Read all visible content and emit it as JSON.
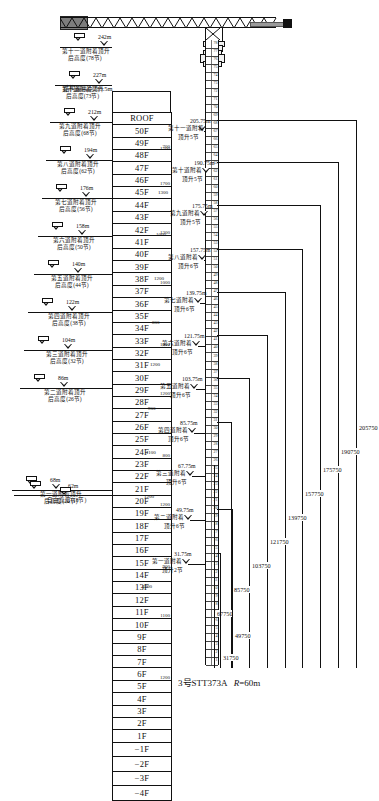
{
  "caption": {
    "model": "3号STT373A",
    "radius_prefix": "R",
    "radius_value": "=60m"
  },
  "structure": {
    "top_label": "结构最高点235.5m"
  },
  "floors": [
    {
      "label": "ROOF",
      "sub": ""
    },
    {
      "label": "50F",
      "sub": ""
    },
    {
      "label": "49F",
      "sub": "700"
    },
    {
      "label": "48F",
      "sub": ""
    },
    {
      "label": "47F",
      "sub": ""
    },
    {
      "label": "46F",
      "sub": "1700"
    },
    {
      "label": "45F",
      "sub": ""
    },
    {
      "label": "44F",
      "sub": ""
    },
    {
      "label": "43F",
      "sub": ""
    },
    {
      "label": "42F",
      "sub": "1300"
    },
    {
      "label": "41F",
      "sub": ""
    },
    {
      "label": "40F",
      "sub": ""
    },
    {
      "label": "39F",
      "sub": ""
    },
    {
      "label": "38F",
      "sub": "1000"
    },
    {
      "label": "37F",
      "sub": ""
    },
    {
      "label": "36F",
      "sub": ""
    },
    {
      "label": "35F",
      "sub": ""
    },
    {
      "label": "34F",
      "sub": ""
    },
    {
      "label": "33F",
      "sub": "1000"
    },
    {
      "label": "32F",
      "sub": ""
    },
    {
      "label": "31F",
      "sub": ""
    },
    {
      "label": "30F",
      "sub": ""
    },
    {
      "label": "29F",
      "sub": "1200"
    },
    {
      "label": "28F",
      "sub": ""
    },
    {
      "label": "27F",
      "sub": ""
    },
    {
      "label": "26F",
      "sub": ""
    },
    {
      "label": "25F",
      "sub": ""
    },
    {
      "label": "24F",
      "sub": "800"
    },
    {
      "label": "23F",
      "sub": ""
    },
    {
      "label": "22F",
      "sub": ""
    },
    {
      "label": "21F",
      "sub": ""
    },
    {
      "label": "20F",
      "sub": "1200"
    },
    {
      "label": "19F",
      "sub": ""
    },
    {
      "label": "18F",
      "sub": ""
    },
    {
      "label": "17F",
      "sub": ""
    },
    {
      "label": "16F",
      "sub": ""
    },
    {
      "label": "15F",
      "sub": "900"
    },
    {
      "label": "14F",
      "sub": ""
    },
    {
      "label": "13F",
      "sub": ""
    },
    {
      "label": "12F",
      "sub": ""
    },
    {
      "label": "11F",
      "sub": "1100"
    },
    {
      "label": "10F",
      "sub": ""
    },
    {
      "label": "9F",
      "sub": ""
    },
    {
      "label": "8F",
      "sub": ""
    },
    {
      "label": "7F",
      "sub": ""
    },
    {
      "label": "6F",
      "sub": "1200"
    },
    {
      "label": "5F",
      "sub": ""
    },
    {
      "label": "4F",
      "sub": ""
    },
    {
      "label": "3F",
      "sub": ""
    },
    {
      "label": "2F",
      "sub": ""
    },
    {
      "label": "1F",
      "sub": ""
    },
    {
      "label": "−1F",
      "sub": ""
    },
    {
      "label": "−2F",
      "sub": ""
    },
    {
      "label": "−3F",
      "sub": ""
    },
    {
      "label": "−4F",
      "sub": ""
    }
  ],
  "left_marks": [
    {
      "height": "242m",
      "note_line1": "第十一道附着顶升",
      "note_line2": "后高度(78节)"
    },
    {
      "height": "227m",
      "note_line1": "第十道附着顶升",
      "note_line2": "后高度(73节)"
    },
    {
      "height": "212m",
      "note_line1": "第九道附着顶升",
      "note_line2": "后高度(68节)"
    },
    {
      "height": "194m",
      "note_line1": "第八道附着顶升",
      "note_line2": "后高度(62节)"
    },
    {
      "height": "176m",
      "note_line1": "第七道附着顶升",
      "note_line2": "后高度(56节)"
    },
    {
      "height": "158m",
      "note_line1": "第六道附着顶升",
      "note_line2": "后高度(50节)"
    },
    {
      "height": "140m",
      "note_line1": "第五道附着顶升",
      "note_line2": "后高度(44节)"
    },
    {
      "height": "122m",
      "note_line1": "第四道附着顶升",
      "note_line2": "后高度(38节)"
    },
    {
      "height": "104m",
      "note_line1": "第三道附着顶升",
      "note_line2": "后高度(32节)"
    },
    {
      "height": "86m",
      "note_line1": "第二道附着顶升",
      "note_line2": "后高度(26节)"
    },
    {
      "height": "68m",
      "note_line1": "第一道附着顶升",
      "note_line2": "后高度(20节)"
    }
  ],
  "free_height": {
    "height": "62m",
    "label": "自由高度(18节)"
  },
  "attachments": [
    {
      "elev": "205.75m",
      "name": "第十一道附着",
      "jack": "顶升5节"
    },
    {
      "elev": "190.75m",
      "name": "第十道附着",
      "jack": "顶升5节"
    },
    {
      "elev": "175.75m",
      "name": "第九道附着",
      "jack": "顶升5节"
    },
    {
      "elev": "157.75m",
      "name": "第八道附着",
      "jack": "顶升6节"
    },
    {
      "elev": "139.75m",
      "name": "第七道附着",
      "jack": "顶升6节"
    },
    {
      "elev": "121.75m",
      "name": "第六道附着",
      "jack": "顶升6节"
    },
    {
      "elev": "103.75m",
      "name": "第五道附着",
      "jack": "顶升6节"
    },
    {
      "elev": "85.75m",
      "name": "第四道附着",
      "jack": "顶升6节"
    },
    {
      "elev": "67.75m",
      "name": "第三道附着",
      "jack": "顶升6节"
    },
    {
      "elev": "49.75m",
      "name": "第二道附着",
      "jack": "顶升6节"
    },
    {
      "elev": "31.75m",
      "name": "第一道附着",
      "jack": "顶升2节"
    }
  ],
  "attachment_offsets": [
    "1700",
    "1300",
    "1000",
    "1200",
    "800",
    "1200",
    "900",
    "1100",
    "1200",
    "4200"
  ],
  "right_dims": [
    "205750",
    "190750",
    "175750",
    "157750",
    "139750",
    "121750",
    "103750",
    "85750",
    "67750",
    "49750",
    "31750"
  ],
  "chart_data": {
    "type": "table",
    "categories": [
      "第一道",
      "第二道",
      "第三道",
      "第四道",
      "第五道",
      "第六道",
      "第七道",
      "第八道",
      "第九道",
      "第十道",
      "第十一道"
    ],
    "series": [
      {
        "name": "附着标高(m)",
        "values": [
          31.75,
          49.75,
          67.75,
          85.75,
          103.75,
          121.75,
          139.75,
          157.75,
          175.75,
          190.75,
          205.75
        ]
      },
      {
        "name": "顶升后高度(m)",
        "values": [
          68,
          86,
          104,
          122,
          140,
          158,
          176,
          194,
          212,
          227,
          242
        ]
      },
      {
        "name": "标准节数",
        "values": [
          20,
          26,
          32,
          38,
          44,
          50,
          56,
          62,
          68,
          73,
          78
        ]
      },
      {
        "name": "顶升节数",
        "values": [
          2,
          6,
          6,
          6,
          6,
          6,
          6,
          6,
          5,
          5,
          5
        ]
      },
      {
        "name": "附着尺寸(mm)",
        "values": [
          31750,
          49750,
          67750,
          85750,
          103750,
          121750,
          139750,
          157750,
          175750,
          190750,
          205750
        ]
      }
    ],
    "xlabel": "附着道次",
    "ylabel": "标高(m)",
    "grid": false,
    "legend": "none"
  }
}
